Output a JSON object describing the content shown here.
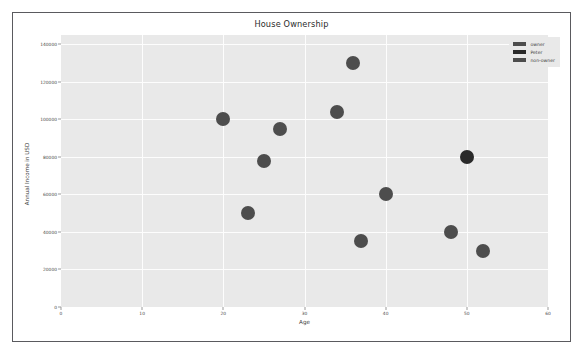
{
  "figure": {
    "background": "#ffffff",
    "frame_color": "#5a5a5e",
    "plot_background": "#e9e9e9",
    "grid_color": "#fdfdfd"
  },
  "chart_data": {
    "type": "scatter",
    "title": "House Ownership",
    "xlabel": "Age",
    "ylabel": "Annual Income in USD",
    "xlim": [
      0,
      60
    ],
    "ylim": [
      0,
      145000
    ],
    "xticks": [
      "0",
      "10",
      "20",
      "30",
      "40",
      "50",
      "60"
    ],
    "xtick_values": [
      0,
      10,
      20,
      30,
      40,
      50,
      60
    ],
    "yticks": [
      "0",
      "20000",
      "40000",
      "60000",
      "80000",
      "100000",
      "120000",
      "140000"
    ],
    "ytick_values": [
      0,
      20000,
      40000,
      60000,
      80000,
      100000,
      120000,
      140000
    ],
    "grid": true,
    "legend_position": "upper right",
    "marker_size": 14,
    "series": [
      {
        "name": "owner",
        "color": "#4d4d4d",
        "points": [
          {
            "x": 20,
            "y": 100000
          },
          {
            "x": 27,
            "y": 95000
          },
          {
            "x": 34,
            "y": 104000
          },
          {
            "x": 36,
            "y": 130000
          },
          {
            "x": 25,
            "y": 78000
          },
          {
            "x": 40,
            "y": 60000
          }
        ]
      },
      {
        "name": "Peter",
        "color": "#2a2a2a",
        "points": [
          {
            "x": 50,
            "y": 80000
          }
        ]
      },
      {
        "name": "non-owner",
        "color": "#4d4d4d",
        "points": [
          {
            "x": 23,
            "y": 50000
          },
          {
            "x": 37,
            "y": 35000
          },
          {
            "x": 48,
            "y": 40000
          },
          {
            "x": 52,
            "y": 30000
          }
        ]
      }
    ]
  },
  "legend": {
    "items": [
      {
        "label": "owner",
        "color": "#4d4d4d"
      },
      {
        "label": "Peter",
        "color": "#2a2a2a"
      },
      {
        "label": "non-owner",
        "color": "#4d4d4d"
      }
    ]
  }
}
